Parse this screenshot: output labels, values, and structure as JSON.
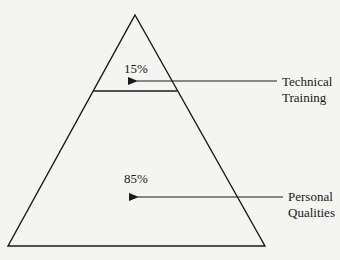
{
  "diagram": {
    "type": "pyramid",
    "levels": [
      {
        "id": "top",
        "percent_label": "15%",
        "percent": 15,
        "callout": [
          "Technical",
          "Training"
        ]
      },
      {
        "id": "bottom",
        "percent_label": "85%",
        "percent": 85,
        "callout": [
          "Personal",
          "Qualities"
        ]
      }
    ],
    "colors": {
      "stroke": "#1a1a1a",
      "background": "#f4f4f2"
    }
  }
}
